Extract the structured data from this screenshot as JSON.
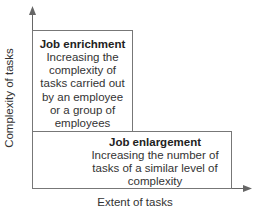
{
  "diagram": {
    "y_axis_label": "Complexity of tasks",
    "x_axis_label": "Extent of tasks",
    "boxes": [
      {
        "title": "Job enrichment",
        "text": "Increasing the complexity of tasks carried out by an employee or a group of employees"
      },
      {
        "title": "Job enlargement",
        "text": "Increasing the number of tasks of a similar level of complexity"
      }
    ],
    "colors": {
      "line": "#666666",
      "text": "#222222"
    }
  }
}
